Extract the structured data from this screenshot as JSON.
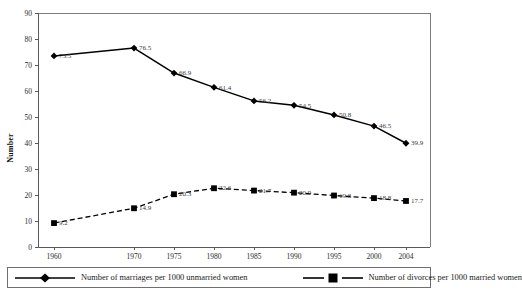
{
  "chart_data": {
    "type": "line",
    "title": "",
    "xlabel": "",
    "ylabel": "Number",
    "ylim": [
      0,
      90
    ],
    "ytick_labels": [
      "0",
      "10",
      "20",
      "30",
      "40",
      "50",
      "60",
      "70",
      "80",
      "90"
    ],
    "grid": false,
    "legend_position": "bottom",
    "categories": [
      "1960",
      "1970",
      "1975",
      "1980",
      "1985",
      "1990",
      "1995",
      "2000",
      "2004"
    ],
    "series": [
      {
        "name": "Number of marriages per 1000 unmarried women",
        "marker": "diamond",
        "line_style": "solid",
        "color": "#000000",
        "values": [
          73.5,
          76.5,
          66.9,
          61.4,
          56.2,
          54.5,
          50.8,
          46.5,
          39.9
        ],
        "value_labels": [
          "73.5",
          "76.5",
          "66.9",
          "61.4",
          "56.2",
          "54.5",
          "50.8",
          "46.5",
          "39.9"
        ]
      },
      {
        "name": "Number of divorces per 1000 married women",
        "marker": "square",
        "line_style": "dashed",
        "color": "#000000",
        "values": [
          9.2,
          14.9,
          20.3,
          22.6,
          21.7,
          20.9,
          19.8,
          18.8,
          17.7
        ],
        "value_labels": [
          "9.2",
          "14.9",
          "20.3",
          "22.6",
          "21.7",
          "20.9",
          "19.8",
          "18.8",
          "17.7"
        ]
      }
    ]
  },
  "legend": {
    "entries": [
      {
        "label": "Number of marriages per 1000 unmarried women",
        "marker": "diamond-marker",
        "style": "solid"
      },
      {
        "label": "Number of divorces per 1000 married women",
        "marker": "square-marker",
        "style": "dashed"
      }
    ]
  },
  "axes": {
    "y_title": "Number"
  }
}
